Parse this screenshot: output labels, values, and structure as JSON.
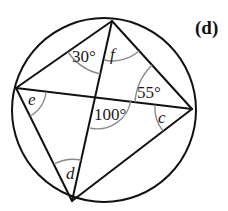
{
  "figure": {
    "tag": "(d)",
    "points": {
      "T": [
        112,
        21
      ],
      "L": [
        16,
        88
      ],
      "R": [
        192,
        109
      ],
      "B": [
        72,
        201
      ],
      "X": [
        97,
        96
      ]
    },
    "circle": {
      "cx": 104,
      "cy": 110,
      "r": 92
    },
    "angle_labels": {
      "a30": "30°",
      "f": "f",
      "a55": "55°",
      "e": "e",
      "a100": "100°",
      "c": "c",
      "d": "d"
    },
    "colors": {
      "line": "#111111",
      "arc": "#8a8a8a",
      "background": "#ffffff"
    }
  }
}
